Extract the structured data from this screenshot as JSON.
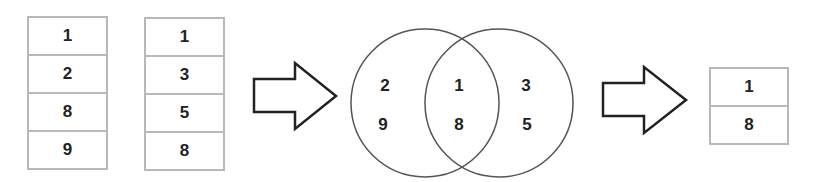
{
  "set_a": {
    "values": [
      "1",
      "2",
      "8",
      "9"
    ]
  },
  "set_b": {
    "values": [
      "1",
      "3",
      "5",
      "8"
    ]
  },
  "venn": {
    "left_only": [
      "2",
      "9"
    ],
    "intersection": [
      "1",
      "8"
    ],
    "right_only": [
      "3",
      "5"
    ]
  },
  "result": {
    "values": [
      "1",
      "8"
    ]
  },
  "colors": {
    "stroke": "#222222",
    "table_border": "#b8b8b8",
    "circle": "#555555"
  }
}
